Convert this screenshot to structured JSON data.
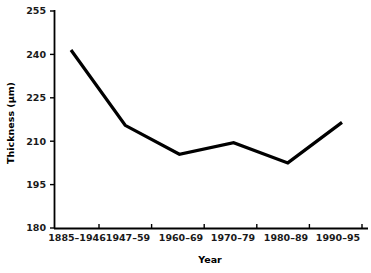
{
  "chart_data": {
    "type": "line",
    "title": "",
    "xlabel": "Year",
    "ylabel": "Thickness (µm)",
    "categories": [
      "1885–1946",
      "1947–59",
      "1960–69",
      "1970–79",
      "1980–89",
      "1990–95"
    ],
    "series": [
      {
        "name": "Thickness",
        "values": [
          241.5,
          215.5,
          205.5,
          209.5,
          202.5,
          216.5
        ],
        "color": "#000000"
      }
    ],
    "ylim": [
      180,
      255
    ],
    "yticks": [
      180,
      195,
      210,
      225,
      240,
      255
    ],
    "ytick_labels": [
      "180",
      "195",
      "210",
      "225",
      "240",
      "255"
    ],
    "grid": false,
    "legend": "none"
  },
  "axes": {
    "x_axis_title": "Year",
    "y_axis_title": "Thickness (µm)"
  }
}
